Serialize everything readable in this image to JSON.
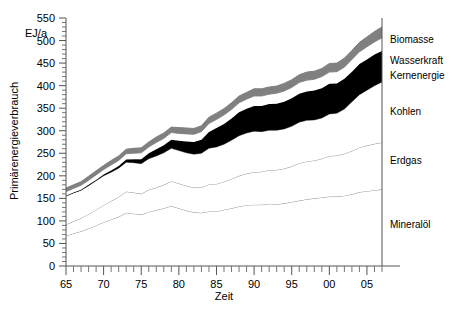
{
  "chart_data": {
    "type": "area",
    "title": "",
    "xlabel": "Zeit",
    "ylabel": "Primärenergieverbrauch",
    "yunit": "EJ/a",
    "xlim": [
      65,
      107
    ],
    "ylim": [
      0,
      550
    ],
    "ytick_step": 50,
    "yticks": [
      0,
      50,
      100,
      150,
      200,
      250,
      300,
      350,
      400,
      450,
      500,
      550
    ],
    "ytick_labels": [
      "0",
      "50",
      "100",
      "150",
      "200",
      "250",
      "300",
      "350",
      "400",
      "450",
      "500",
      "550"
    ],
    "xticks": [
      65,
      70,
      75,
      80,
      85,
      90,
      95,
      100,
      105
    ],
    "xtick_labels": [
      "65",
      "70",
      "75",
      "80",
      "85",
      "90",
      "95",
      "00",
      "05"
    ],
    "grid": false,
    "legend_position": "right-inline",
    "stacked": true,
    "x": [
      65,
      66,
      67,
      68,
      69,
      70,
      71,
      72,
      73,
      74,
      75,
      76,
      77,
      78,
      79,
      80,
      81,
      82,
      83,
      84,
      85,
      86,
      87,
      88,
      89,
      90,
      91,
      92,
      93,
      94,
      95,
      96,
      97,
      98,
      99,
      100,
      101,
      102,
      103,
      104,
      105,
      106,
      107
    ],
    "series": [
      {
        "name": "Mineralöl",
        "color": "#ffffff",
        "stroke": "#888888",
        "values": [
          67,
          72,
          77,
          83,
          90,
          97,
          103,
          109,
          118,
          116,
          114,
          120,
          124,
          128,
          133,
          128,
          123,
          119,
          118,
          121,
          121,
          125,
          128,
          132,
          135,
          136,
          136,
          138,
          137,
          139,
          142,
          145,
          148,
          150,
          152,
          154,
          154,
          156,
          159,
          164,
          166,
          168,
          170
        ]
      },
      {
        "name": "Erdgas",
        "color": "#ffffff",
        "stroke": "#888888",
        "values": [
          25,
          27,
          29,
          32,
          35,
          38,
          41,
          44,
          47,
          47,
          46,
          49,
          50,
          52,
          55,
          55,
          55,
          55,
          56,
          60,
          61,
          62,
          65,
          68,
          70,
          72,
          73,
          75,
          76,
          77,
          79,
          83,
          84,
          84,
          86,
          90,
          91,
          93,
          96,
          99,
          101,
          103,
          104
        ]
      },
      {
        "name": "Kohlen",
        "color": "#ffffff",
        "stroke": "#888888",
        "values": [
          63,
          63,
          62,
          63,
          64,
          65,
          64,
          64,
          65,
          66,
          67,
          69,
          70,
          71,
          73,
          73,
          73,
          74,
          76,
          80,
          82,
          83,
          86,
          89,
          90,
          91,
          89,
          88,
          88,
          88,
          89,
          91,
          91,
          90,
          90,
          93,
          94,
          99,
          109,
          117,
          123,
          129,
          134
        ]
      },
      {
        "name": "Kernenergie",
        "color": "#000000",
        "stroke": "#000000",
        "values": [
          1,
          1,
          1,
          2,
          2,
          3,
          4,
          5,
          6,
          8,
          10,
          12,
          15,
          17,
          19,
          22,
          25,
          27,
          30,
          36,
          42,
          45,
          48,
          52,
          54,
          56,
          57,
          58,
          59,
          60,
          62,
          63,
          64,
          65,
          66,
          67,
          66,
          67,
          67,
          68,
          68,
          69,
          69
        ]
      },
      {
        "name": "Wasserkraft",
        "color": "#ffffff",
        "stroke": "#888888",
        "values": [
          9,
          9,
          10,
          10,
          11,
          11,
          12,
          12,
          13,
          13,
          14,
          14,
          15,
          15,
          16,
          16,
          17,
          17,
          18,
          19,
          19,
          20,
          20,
          21,
          21,
          22,
          22,
          22,
          23,
          24,
          24,
          25,
          25,
          25,
          26,
          26,
          26,
          26,
          27,
          27,
          28,
          28,
          29
        ]
      },
      {
        "name": "Biomasse",
        "color": "#808080",
        "stroke": "#808080",
        "values": [
          8,
          8,
          8,
          9,
          9,
          9,
          10,
          10,
          10,
          11,
          11,
          11,
          12,
          12,
          12,
          13,
          13,
          13,
          13,
          14,
          14,
          14,
          15,
          15,
          15,
          16,
          16,
          16,
          16,
          17,
          17,
          17,
          18,
          18,
          18,
          19,
          19,
          20,
          20,
          21,
          22,
          23,
          24
        ]
      }
    ],
    "series_labels": [
      {
        "name": "Biomasse",
        "x": 390,
        "y": 43
      },
      {
        "name": "Wasserkraft",
        "x": 390,
        "y": 64
      },
      {
        "name": "Kernenergie",
        "x": 390,
        "y": 79
      },
      {
        "name": "Kohlen",
        "x": 390,
        "y": 115
      },
      {
        "name": "Erdgas",
        "x": 390,
        "y": 164
      },
      {
        "name": "Mineralöl",
        "x": 390,
        "y": 228
      }
    ]
  }
}
